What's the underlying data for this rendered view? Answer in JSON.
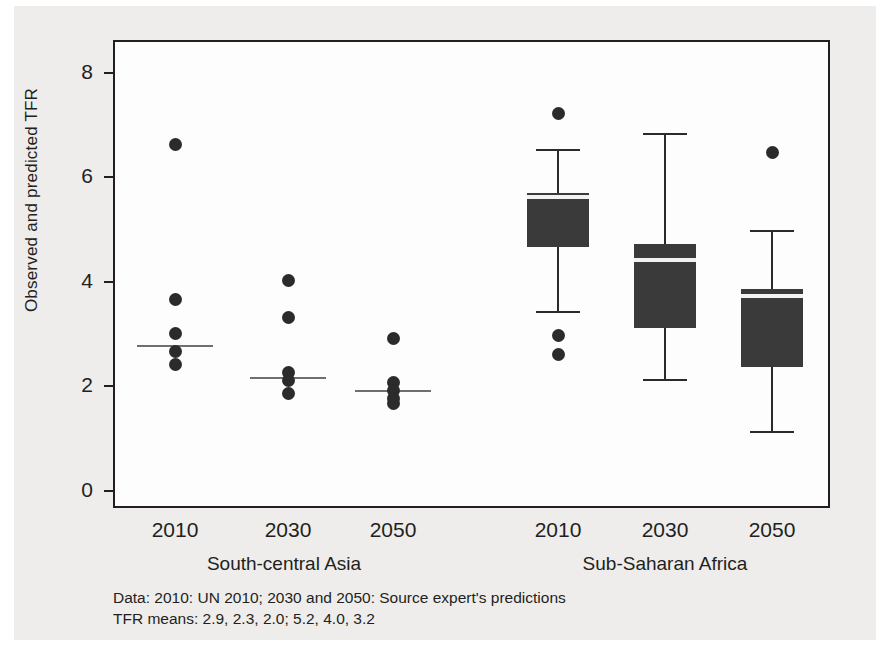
{
  "figure": {
    "axis_title_y": "Observed and predicted TFR",
    "caption_line1": "Data: 2010: UN 2010; 2030 and 2050: Source expert's predictions",
    "caption_line2": "TFR means: 2.9, 2.3, 2.0; 5.2, 4.0, 3.2",
    "colors": {
      "figure_background": "#eeedec",
      "panel_background": "#fdfdfd",
      "frame": "#231f20",
      "box_fill": "#3a3a3a",
      "median_light": "#f2f2f2",
      "median_grey": "#6f6f6f",
      "dot": "#2b2b2b"
    }
  },
  "chart_data": {
    "type": "box",
    "title": "",
    "xlabel": "",
    "ylabel": "Observed and predicted TFR",
    "ylim": [
      0,
      8.4
    ],
    "yticks": [
      0,
      2,
      4,
      6,
      8
    ],
    "grid": false,
    "legend": "none",
    "groups": [
      "South-central Asia",
      "Sub-Saharan Africa"
    ],
    "categories": [
      "2010",
      "2030",
      "2050",
      "2010",
      "2030",
      "2050"
    ],
    "means": [
      2.9,
      2.3,
      2.0,
      5.2,
      4.0,
      3.2
    ],
    "series": [
      {
        "group": "South-central Asia",
        "year": "2010",
        "render": "strip",
        "median": 2.75,
        "points": [
          6.6,
          3.65,
          3.0,
          2.65,
          2.4
        ]
      },
      {
        "group": "South-central Asia",
        "year": "2030",
        "render": "strip",
        "median": 2.15,
        "points": [
          4.0,
          3.3,
          2.25,
          2.1,
          1.85
        ]
      },
      {
        "group": "South-central Asia",
        "year": "2050",
        "render": "strip",
        "median": 1.9,
        "points": [
          2.9,
          2.05,
          1.9,
          1.75,
          1.65
        ]
      },
      {
        "group": "Sub-Saharan Africa",
        "year": "2010",
        "render": "box",
        "whisker_low": 3.4,
        "q1": 4.65,
        "median": 5.6,
        "q3": 5.68,
        "whisker_high": 6.5,
        "outliers": [
          7.2,
          2.95,
          2.6
        ]
      },
      {
        "group": "Sub-Saharan Africa",
        "year": "2030",
        "render": "box",
        "whisker_low": 2.1,
        "q1": 3.1,
        "median": 4.4,
        "q3": 4.7,
        "whisker_high": 6.8,
        "outliers": []
      },
      {
        "group": "Sub-Saharan Africa",
        "year": "2050",
        "render": "box",
        "whisker_low": 1.1,
        "q1": 2.35,
        "median": 3.7,
        "q3": 3.85,
        "whisker_high": 4.95,
        "outliers": [
          6.45
        ]
      }
    ]
  }
}
